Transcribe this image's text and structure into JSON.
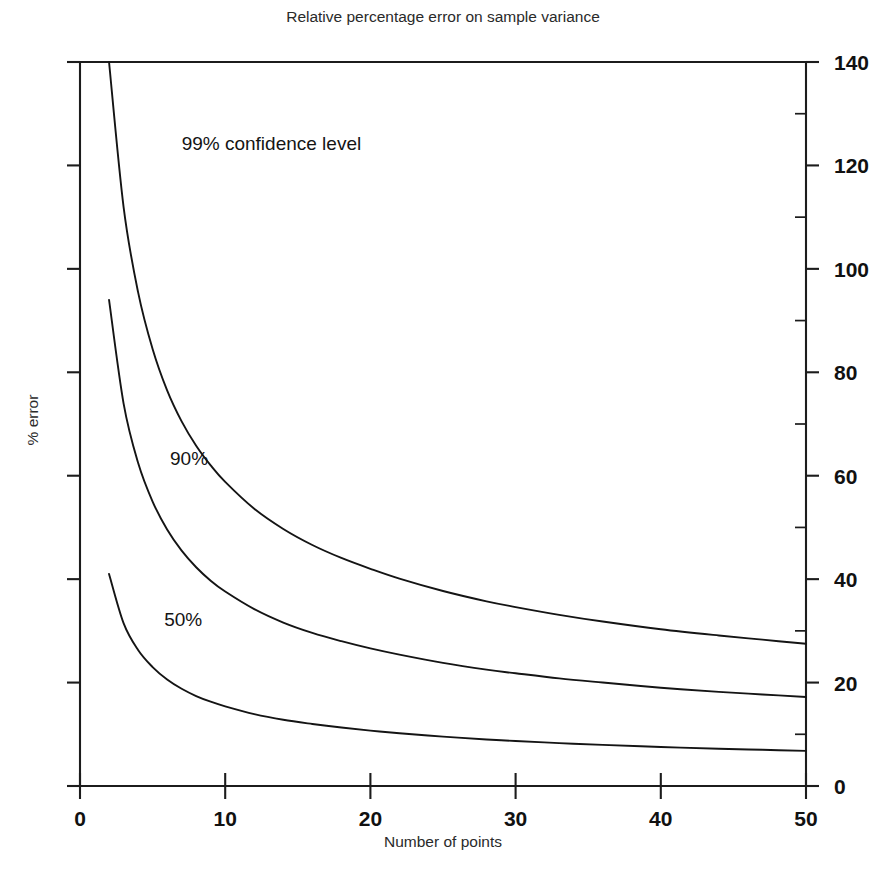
{
  "chart_data": {
    "type": "line",
    "title": "Relative percentage error on sample variance",
    "xlabel": "Number of points",
    "ylabel": "% error",
    "xlim": [
      0,
      50
    ],
    "ylim": [
      0,
      140
    ],
    "xticks": [
      0,
      10,
      20,
      30,
      40,
      50
    ],
    "yticks": [
      0,
      20,
      40,
      60,
      80,
      100,
      120,
      140
    ],
    "xtick_labels": [
      "0",
      "10",
      "20",
      "30",
      "40",
      "50"
    ],
    "ytick_labels": [
      "0",
      "20",
      "40",
      "60",
      "80",
      "100",
      "120",
      "140"
    ],
    "y_axis_position": "right",
    "grid": false,
    "legend": "inline-annotations",
    "line_color": "#141414",
    "background": "#ffffff",
    "x": [
      2,
      3,
      4,
      5,
      6,
      7,
      8,
      9,
      10,
      12,
      14,
      16,
      18,
      20,
      22,
      25,
      28,
      30,
      33,
      36,
      40,
      44,
      47,
      50
    ],
    "series": [
      {
        "name": "99% confidence level",
        "label": "99%  confidence level",
        "label_x": 7,
        "label_y": 123,
        "values": [
          140.0,
          112.0,
          95.5,
          84.5,
          76.5,
          70.5,
          65.8,
          62.0,
          58.8,
          53.6,
          49.7,
          46.6,
          44.1,
          42.0,
          40.1,
          37.7,
          35.7,
          34.6,
          33.1,
          31.8,
          30.3,
          29.1,
          28.3,
          27.5
        ]
      },
      {
        "name": "90% confidence level",
        "label": "90%",
        "label_x": 6.2,
        "label_y": 62,
        "values": [
          94.0,
          74.0,
          62.5,
          55.0,
          49.6,
          45.5,
          42.3,
          39.7,
          37.6,
          34.2,
          31.6,
          29.6,
          28.0,
          26.6,
          25.4,
          23.8,
          22.5,
          21.8,
          20.8,
          20.0,
          19.0,
          18.2,
          17.7,
          17.2
        ]
      },
      {
        "name": "50% confidence level",
        "label": "50%",
        "label_x": 5.8,
        "label_y": 31,
        "values": [
          41.0,
          31.5,
          26.3,
          23.0,
          20.6,
          18.8,
          17.4,
          16.3,
          15.4,
          13.9,
          12.8,
          12.0,
          11.3,
          10.7,
          10.2,
          9.55,
          9.0,
          8.7,
          8.3,
          7.95,
          7.55,
          7.2,
          7.0,
          6.8
        ]
      }
    ]
  },
  "figure": {
    "title": "Relative percentage error on sample variance",
    "x_axis_title": "Number of points",
    "y_axis_title": "% error"
  }
}
